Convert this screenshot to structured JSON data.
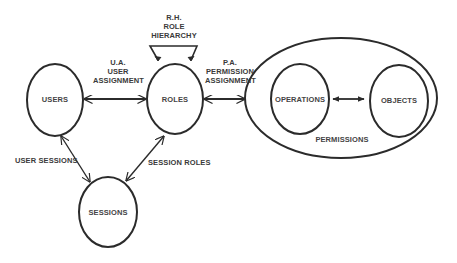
{
  "diagram": {
    "title": "",
    "nodes": {
      "users": "USERS",
      "roles": "ROLES",
      "sessions": "SESSIONS",
      "operations": "OPERATIONS",
      "objects": "OBJECTS",
      "permissions": "PERMISSIONS"
    },
    "edges": {
      "ua_line1": "U.A.",
      "ua_line2": "USER",
      "ua_line3": "ASSIGNMENT",
      "rh_line1": "R.H.",
      "rh_line2": "ROLE",
      "rh_line3": "HIERARCHY",
      "pa_line1": "P.A.",
      "pa_line2": "PERMISSION",
      "pa_line3": "ASSIGNMENT",
      "user_sessions": "USER SESSIONS",
      "session_roles": "SESSION ROLES"
    },
    "colors": {
      "stroke": "#2b2b2b",
      "text": "#3a3a3a",
      "background": "#ffffff"
    }
  }
}
